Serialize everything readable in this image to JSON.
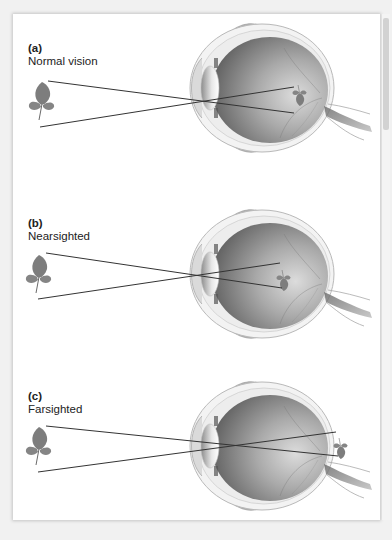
{
  "figure": {
    "panels": [
      {
        "letter": "(a)",
        "title": "Normal vision",
        "focus": "on retina"
      },
      {
        "letter": "(b)",
        "title": "Nearsighted",
        "focus": "in front of retina"
      },
      {
        "letter": "(c)",
        "title": "Farsighted",
        "focus": "behind retina"
      }
    ],
    "object_icon": "leaf",
    "colors": {
      "background": "#ffffff",
      "ray": "#333333",
      "eyeball": "#8a8a8a",
      "leaf": "#7a7a7a"
    }
  }
}
